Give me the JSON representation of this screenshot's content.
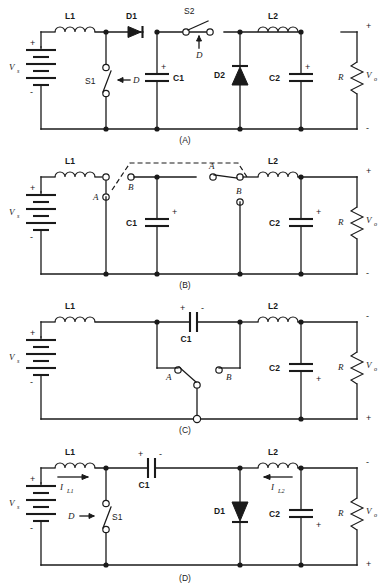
{
  "figure": {
    "panels": [
      {
        "id": "A",
        "caption": "(A)",
        "description": "Buck-boost / Cuk switch-diode realization with two switches",
        "components": {
          "source": "V",
          "source_sub": "s",
          "inductor_left": "L1",
          "inductor_right": "L2",
          "diode_left": "D1",
          "diode_right": "D2",
          "switch_left": "S1",
          "switch_right": "S2",
          "duty_left": "D",
          "duty_right": "D",
          "cap_left": "C1",
          "cap_right": "C2",
          "load": "R",
          "output": "V",
          "output_sub": "o"
        },
        "polarity": {
          "source_plus": "+",
          "source_minus": "-",
          "c1_plus": "+",
          "c2_plus": "+",
          "out_plus": "+",
          "out_minus": "-"
        }
      },
      {
        "id": "B",
        "caption": "(B)",
        "description": "Ganged SPDT switch realization, positions A and B",
        "components": {
          "source": "V",
          "source_sub": "s",
          "inductor_left": "L1",
          "inductor_right": "L2",
          "switch_left_pos_a": "A",
          "switch_left_pos_b": "B",
          "switch_right_pos_a": "A",
          "switch_right_pos_b": "B",
          "cap_left": "C1",
          "cap_right": "C2",
          "load": "R",
          "output": "V",
          "output_sub": "o"
        },
        "polarity": {
          "source_plus": "+",
          "source_minus": "-",
          "c1_plus": "+",
          "c2_plus": "+",
          "out_plus": "+",
          "out_minus": "-"
        }
      },
      {
        "id": "C",
        "caption": "(C)",
        "description": "Cuk converter with series capacitor C1 and SPDT switch A/B",
        "components": {
          "source": "V",
          "source_sub": "s",
          "inductor_left": "L1",
          "inductor_right": "L2",
          "cap_series": "C1",
          "cap_out": "C2",
          "switch_pos_a": "A",
          "switch_pos_b": "B",
          "load": "R",
          "output": "V",
          "output_sub": "o"
        },
        "polarity": {
          "source_plus": "+",
          "source_minus": "-",
          "c1_plus": "+",
          "c1_minus": "-",
          "c2_plus": "+",
          "out_minus": "-",
          "out_plus": "+"
        }
      },
      {
        "id": "D",
        "caption": "(D)",
        "description": "Cuk converter with transistor switch S1 and diode D1, inductor currents labeled",
        "components": {
          "source": "V",
          "source_sub": "s",
          "inductor_left": "L1",
          "inductor_right": "L2",
          "cap_series": "C1",
          "cap_out": "C2",
          "switch": "S1",
          "duty": "D",
          "diode": "D1",
          "load": "R",
          "output": "V",
          "output_sub": "o",
          "current_left": "I",
          "current_left_sub": "L1",
          "current_right": "I",
          "current_right_sub": "L2"
        },
        "polarity": {
          "source_plus": "+",
          "source_minus": "-",
          "c1_plus": "+",
          "c1_minus": "-",
          "c2_plus": "+",
          "out_minus": "-",
          "out_plus": "+"
        }
      }
    ],
    "colors": {
      "ink": "#1a1a1a",
      "background": "#ffffff"
    }
  }
}
